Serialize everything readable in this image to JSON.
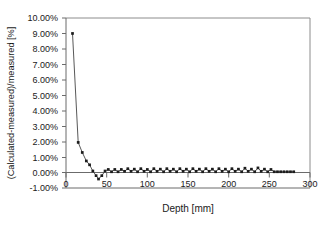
{
  "chart_data": {
    "type": "line",
    "title": "",
    "xlabel": "Depth [mm]",
    "ylabel": "(Calculated-measured)/measured [%]",
    "xlim": [
      0,
      300
    ],
    "ylim": [
      -1,
      10
    ],
    "xticks": [
      0,
      50,
      100,
      150,
      200,
      250,
      300
    ],
    "xtick_labels": [
      "0",
      "50",
      "100",
      "150",
      "200",
      "250",
      "300"
    ],
    "yticks": [
      -1,
      0,
      1,
      2,
      3,
      4,
      5,
      6,
      7,
      8,
      9,
      10
    ],
    "ytick_labels": [
      "-1.00%",
      "0.00%",
      "1.00%",
      "2.00%",
      "3.00%",
      "4.00%",
      "5.00%",
      "6.00%",
      "7.00%",
      "8.00%",
      "9.00%",
      "10.00%"
    ],
    "grid": false,
    "legend": null,
    "legend_position": "none",
    "marker": "square",
    "series": [
      {
        "name": "relative deviation",
        "x": [
          8,
          15,
          20,
          25,
          29,
          33,
          37,
          40,
          44,
          48,
          52,
          56,
          60,
          64,
          68,
          72,
          76,
          80,
          84,
          88,
          92,
          96,
          100,
          104,
          108,
          112,
          116,
          120,
          124,
          128,
          132,
          136,
          140,
          144,
          148,
          152,
          156,
          160,
          164,
          168,
          172,
          176,
          180,
          184,
          188,
          192,
          196,
          200,
          204,
          208,
          212,
          216,
          220,
          224,
          228,
          232,
          236,
          240,
          244,
          248,
          252,
          256,
          260,
          264,
          268,
          272,
          276,
          280
        ],
        "y": [
          9.0,
          1.95,
          1.3,
          0.75,
          0.5,
          0.1,
          -0.2,
          -0.42,
          -0.2,
          0.1,
          0.2,
          0.05,
          0.2,
          0.05,
          0.2,
          0.08,
          0.25,
          0.08,
          0.22,
          0.05,
          0.25,
          0.08,
          0.2,
          0.05,
          0.25,
          0.08,
          0.22,
          0.05,
          0.25,
          0.08,
          0.22,
          0.05,
          0.25,
          0.08,
          0.22,
          0.05,
          0.25,
          0.08,
          0.22,
          0.05,
          0.25,
          0.08,
          0.22,
          0.05,
          0.25,
          0.08,
          0.22,
          0.05,
          0.25,
          0.08,
          0.22,
          0.05,
          0.28,
          0.08,
          0.22,
          0.05,
          0.3,
          0.08,
          0.22,
          0.05,
          0.2,
          0.05,
          0.05,
          0.05,
          0.05,
          0.05,
          0.05,
          0.05
        ]
      }
    ]
  },
  "axes": {
    "x_title": "Depth [mm]",
    "y_title": "(Calculated-measured)/measured [%]"
  }
}
